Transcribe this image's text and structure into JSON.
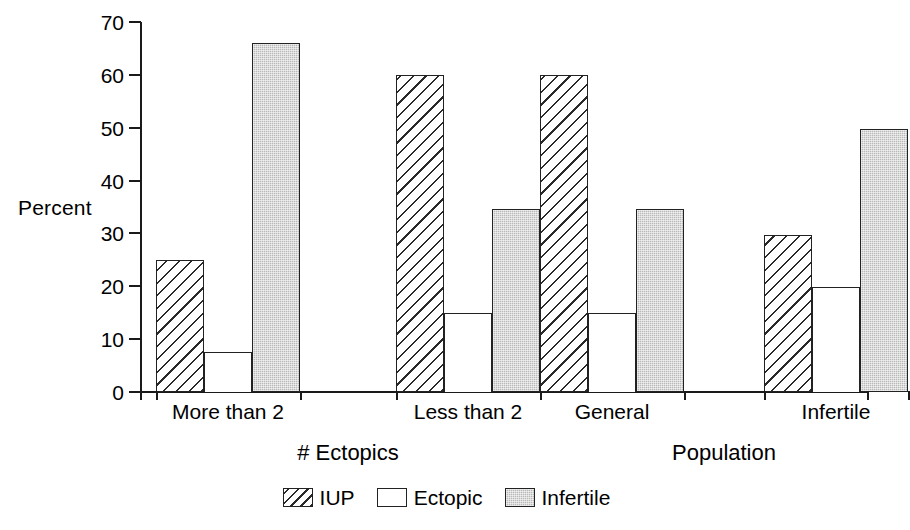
{
  "chart_data": {
    "type": "bar",
    "title": "",
    "subtitle": "",
    "xlabel": "",
    "ylabel": "Percent",
    "ylim": [
      0,
      70
    ],
    "ytick_values": [
      0,
      10,
      20,
      30,
      40,
      50,
      60,
      70
    ],
    "ytick_labels": [
      "0",
      "10",
      "20",
      "30",
      "40",
      "50",
      "60",
      "70"
    ],
    "grid": false,
    "legend_position": "bottom-center",
    "categories": [
      "More than 2",
      "Less than 2",
      "General",
      "Infertile"
    ],
    "group_axis_labels": [
      {
        "label": "# Ectopics",
        "categories": [
          "More than 2",
          "Less than 2"
        ]
      },
      {
        "label": "Population",
        "categories": [
          "General",
          "Infertile"
        ]
      }
    ],
    "series": [
      {
        "name": "IUP",
        "pattern": "diagonal-hatch",
        "values": [
          25,
          60,
          60,
          29.8
        ]
      },
      {
        "name": "Ectopic",
        "pattern": "solid-white",
        "values": [
          7.6,
          15,
          15,
          19.8
        ]
      },
      {
        "name": "Infertile",
        "pattern": "gray-stipple",
        "values": [
          66,
          34.6,
          34.6,
          49.7
        ]
      }
    ],
    "colors": {
      "axis": "#1a1a1a",
      "bar_outline": "#222222",
      "iup_fill": "#ffffff",
      "iup_hatch": "#2a2a2a",
      "ectopic_fill": "#ffffff",
      "infertile_fill": "#b9b9b9",
      "background": "#ffffff"
    }
  },
  "legend": {
    "items": [
      {
        "label": "IUP",
        "swatch": "hatched-swatch-icon"
      },
      {
        "label": "Ectopic",
        "swatch": "white-swatch-icon"
      },
      {
        "label": "Infertile",
        "swatch": "gray-swatch-icon"
      }
    ]
  }
}
